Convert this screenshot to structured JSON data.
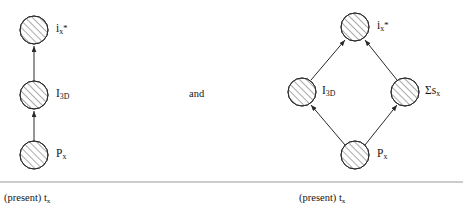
{
  "figure": {
    "background_color": "#ffffff",
    "stroke_color": "#2a2a2a",
    "rule_color": "#9a9a9a",
    "panels": [
      {
        "id": "left-panel",
        "layout": "vertical-chain",
        "nodes": [
          {
            "id": "left-i",
            "label_main": "i",
            "label_sub": "x",
            "label_sup": "*",
            "cx": 34,
            "cy": 30,
            "r": 14
          },
          {
            "id": "left-i3d",
            "label_main": "I",
            "label_sub": "3D",
            "label_sup": "",
            "cx": 34,
            "cy": 95,
            "r": 14
          },
          {
            "id": "left-p",
            "label_main": "P",
            "label_sub": "x",
            "label_sup": "",
            "cx": 34,
            "cy": 155,
            "r": 14
          }
        ],
        "edges": [
          {
            "from": "left-p",
            "to": "left-i3d",
            "arrow": "to"
          },
          {
            "from": "left-i3d",
            "to": "left-i",
            "arrow": "to"
          }
        ],
        "caption": "(present) t",
        "caption_sub": "x"
      },
      {
        "id": "right-panel",
        "layout": "diamond",
        "nodes": [
          {
            "id": "right-i",
            "label_main": "i",
            "label_sub": "x",
            "label_sup": "*",
            "cx": 355,
            "cy": 27,
            "r": 14
          },
          {
            "id": "right-i3d",
            "label_main": "I",
            "label_sub": "3D",
            "label_sup": "",
            "cx": 302,
            "cy": 92,
            "r": 14
          },
          {
            "id": "right-sum",
            "label_main": "Σs",
            "label_sub": "x",
            "label_sup": "",
            "cx": 405,
            "cy": 92,
            "r": 14
          },
          {
            "id": "right-p",
            "label_main": "P",
            "label_sub": "x",
            "label_sup": "",
            "cx": 355,
            "cy": 155,
            "r": 14
          }
        ],
        "edges": [
          {
            "from": "right-p",
            "to": "right-i3d",
            "arrow": "to"
          },
          {
            "from": "right-p",
            "to": "right-sum",
            "arrow": "to"
          },
          {
            "from": "right-i3d",
            "to": "right-i",
            "arrow": "to"
          },
          {
            "from": "right-sum",
            "to": "right-i",
            "arrow": "to"
          }
        ],
        "caption": "(present) t",
        "caption_sub": "x"
      }
    ],
    "conjunction": "and",
    "baseline_rule": {
      "y": 182,
      "x1": 0,
      "x2": 463
    },
    "labels": {
      "left_i_main": "i",
      "left_i_sub": "x",
      "left_i_sup": "*",
      "left_i3d_main": "I",
      "left_i3d_sub": "3D",
      "left_p_main": "P",
      "left_p_sub": "x",
      "right_i_main": "i",
      "right_i_sub": "x",
      "right_i_sup": "*",
      "right_i3d_main": "I",
      "right_i3d_sub": "3D",
      "right_sum_main": "Σs",
      "right_sum_sub": "x",
      "right_p_main": "P",
      "right_p_sub": "x",
      "conjunction": "and",
      "left_caption_main": "(present) t",
      "left_caption_sub": "x",
      "right_caption_main": "(present) t",
      "right_caption_sub": "x"
    }
  }
}
